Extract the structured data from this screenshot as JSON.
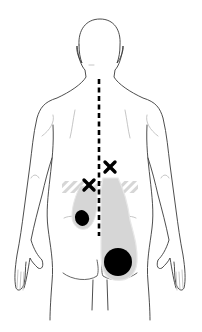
{
  "figure": {
    "colors": {
      "background": "#ffffff",
      "outline": "#3a3a3a",
      "faint_line": "#b8b8b8",
      "pain_zone": "#d4d4d4",
      "pain_zone_edge": "#e6e6e6",
      "hatch": "#c8c8c8",
      "marker": "#000000"
    },
    "markers": [
      {
        "type": "cross",
        "label": "trigger-point-right",
        "x": 110,
        "y": 167
      },
      {
        "type": "cross",
        "label": "trigger-point-left",
        "x": 89,
        "y": 185
      }
    ],
    "pain_spots": [
      {
        "label": "small-buttock-spot",
        "cx": 82,
        "cy": 218,
        "rx": 7,
        "ry": 8
      },
      {
        "label": "large-buttock-spot",
        "cx": 118,
        "cy": 262,
        "rx": 14,
        "ry": 14
      }
    ],
    "midline": {
      "x": 99,
      "y_start": 79,
      "y_end": 236,
      "style": "dashed"
    }
  }
}
